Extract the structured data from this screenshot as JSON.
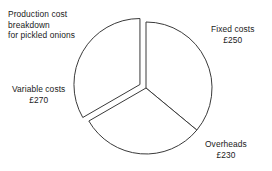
{
  "title": {
    "line1": "Production cost",
    "line2": "breakdown",
    "line3": "for pickled onions"
  },
  "labels": {
    "fixed": {
      "name": "Fixed costs",
      "value": "£250"
    },
    "variable": {
      "name": "Variable costs",
      "value": "£270"
    },
    "overheads": {
      "name": "Overheads",
      "value": "£230"
    }
  },
  "colors": {
    "stroke": "#3a3a3a",
    "fill": "#ffffff",
    "background": "#ffffff",
    "text": "#1a1a1a"
  },
  "chart_data": {
    "type": "pie",
    "title": "Production cost breakdown for pickled onions",
    "currency": "£",
    "total": 750,
    "categories": [
      "Fixed costs",
      "Variable costs",
      "Overheads"
    ],
    "values": [
      250,
      270,
      230
    ],
    "value_labels": [
      "£250",
      "£270",
      "£230"
    ],
    "percentages": [
      33.3,
      36.0,
      30.7
    ],
    "angles_deg": [
      120.0,
      129.6,
      110.4
    ],
    "exploded": [
      "Fixed costs"
    ],
    "legend": "none",
    "grid": false,
    "geometry": {
      "center_x": 146,
      "center_y": 88,
      "radius": 66,
      "explode_offset": 7,
      "start_angle_deg": -120,
      "direction": "clockwise",
      "slice_start_end_deg": [
        [
          -120,
          0
        ],
        [
          129.6,
          240
        ],
        [
          0,
          110.4
        ]
      ]
    }
  }
}
